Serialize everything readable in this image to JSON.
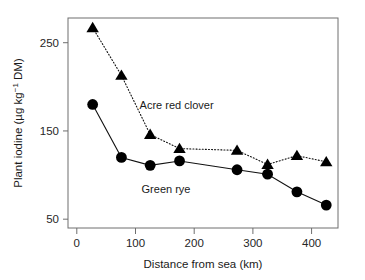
{
  "chart_data": {
    "type": "line",
    "title": "",
    "xlabel": "Distance from sea (km)",
    "ylabel": "Plant iodine (µg kg⁻¹ DM)",
    "ylabel_parts": {
      "main": "Plant iodine (µg kg",
      "superscript": "−1",
      "tail": " DM)"
    },
    "xlim": [
      -15,
      445
    ],
    "ylim": [
      40,
      278
    ],
    "grid": false,
    "legend_position": "inline-annotations",
    "xticks": [
      0,
      100,
      200,
      300,
      400
    ],
    "xtick_labels": [
      "0",
      "100",
      "200",
      "300",
      "400"
    ],
    "yticks": [
      50,
      150,
      250
    ],
    "ytick_labels": [
      "50",
      "150",
      "250"
    ],
    "series": [
      {
        "name": "Acre red clover",
        "marker": "triangle",
        "linestyle": "dotted",
        "color": "#000000",
        "x": [
          27,
          76,
          125,
          175,
          273,
          325,
          375,
          425
        ],
        "values": [
          267,
          213,
          146,
          130,
          128,
          112,
          122,
          115
        ]
      },
      {
        "name": "Green rye",
        "marker": "circle",
        "linestyle": "solid",
        "color": "#000000",
        "x": [
          27,
          76,
          125,
          175,
          273,
          325,
          375,
          425
        ],
        "values": [
          180,
          120,
          111,
          116,
          106,
          101,
          81,
          66
        ]
      }
    ],
    "annotations": [
      {
        "text": "Acre red clover",
        "x": 170,
        "y": 175
      },
      {
        "text": "Green rye",
        "x": 152,
        "y": 80
      }
    ]
  },
  "axes": {
    "x_title": "Distance from sea (km)",
    "y_title_main": "Plant iodine (µg kg",
    "y_title_sup": "−1",
    "y_title_tail": " DM)"
  },
  "colors": {
    "marker": "#000000",
    "line": "#111111",
    "axis": "#6e6e6e",
    "text": "#1a1a1a",
    "background": "#ffffff"
  }
}
